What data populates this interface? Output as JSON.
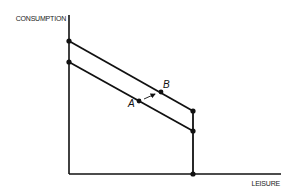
{
  "diagram": {
    "y_axis_label": "CONSUMPTION",
    "x_axis_label": "LEISURE",
    "points": {
      "A": {
        "label": "A"
      },
      "B": {
        "label": "B"
      }
    },
    "lines": [
      {
        "name": "upper-budget-line",
        "description": "higher budget constraint through B"
      },
      {
        "name": "lower-budget-line",
        "description": "lower budget constraint through A"
      }
    ],
    "annotation": "arrow from A to B",
    "colors": {
      "ink": "#111111",
      "background": "#ffffff"
    }
  }
}
